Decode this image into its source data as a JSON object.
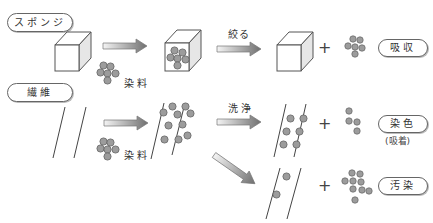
{
  "labels": {
    "sponge": "スポンジ",
    "fiber": "繊維",
    "dye_top": "染料",
    "dye_bottom": "染料",
    "squeeze": "絞る",
    "wash": "洗浄",
    "absorption": "吸収",
    "dyeing": "染色",
    "dyeing_note": "(吸着)",
    "staining": "汚染",
    "plus": "+"
  },
  "colors": {
    "dye_particle": "#999999",
    "particle_stroke": "#666666",
    "line": "#333333",
    "pill_border": "#666666",
    "arrow_light": "#f2f2f2",
    "arrow_dark": "#777777"
  }
}
